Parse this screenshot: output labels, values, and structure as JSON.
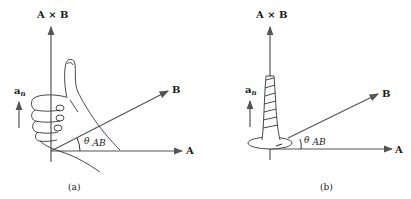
{
  "panels": [
    {
      "caption": "(a)",
      "axis_vertical_label": "A × B",
      "axis_A_label": "A",
      "axis_B_label": "B",
      "unit_vector_label": "a",
      "unit_vector_subscript": "n",
      "angle_label": "θ",
      "angle_subscript": "AB",
      "illustration": "right-hand-thumb"
    },
    {
      "caption": "(b)",
      "axis_vertical_label": "A × B",
      "axis_A_label": "A",
      "axis_B_label": "B",
      "unit_vector_label": "a",
      "unit_vector_subscript": "n",
      "angle_label": "θ",
      "angle_subscript": "AB",
      "illustration": "right-hand-screw"
    }
  ],
  "colors": {
    "line": "#555555",
    "text": "#1a1a1a",
    "background": "#ffffff"
  }
}
